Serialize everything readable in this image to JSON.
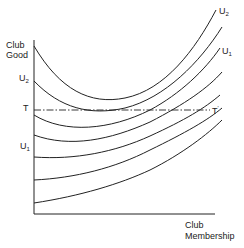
{
  "diagram": {
    "title": "",
    "y_axis_label": [
      "Club",
      "Good"
    ],
    "x_axis_label": [
      "Club",
      "Membership"
    ],
    "left_labels": [
      {
        "text": "U",
        "sub": "2"
      },
      {
        "text": "T",
        "sub": ""
      },
      {
        "text": "U",
        "sub": "1"
      }
    ],
    "right_labels": [
      {
        "text": "U",
        "sub": "2"
      },
      {
        "text": "U",
        "sub": "1"
      },
      {
        "text": "T",
        "sub": "'"
      }
    ],
    "curves": [
      {
        "name": "indifference-curve-1",
        "d": "M34,46 C60,90 90,105 125,98 C165,90 195,50 216,10"
      },
      {
        "name": "indifference-curve-2",
        "d": "M34,81 C60,108 90,116 125,108 C165,98 200,62 222,27"
      },
      {
        "name": "indifference-curve-3",
        "d": "M34,115 C65,134 110,130 150,110 C180,94 205,70 220,48"
      },
      {
        "name": "indifference-curve-4",
        "d": "M34,135 C70,148 110,140 150,122 C185,104 208,88 222,72"
      },
      {
        "name": "indifference-curve-5",
        "d": "M34,157 C75,160 115,152 150,136 C185,120 205,108 220,95"
      },
      {
        "name": "indifference-curve-6",
        "d": "M34,180 C75,178 115,168 150,150 C185,133 208,120 222,108"
      },
      {
        "name": "indifference-curve-7",
        "d": "M34,203 C80,196 120,184 150,170 C182,154 208,134 222,120"
      }
    ],
    "t_line": {
      "y": 110,
      "x1": 34,
      "x2": 210
    },
    "colors": {
      "line": "#222222",
      "background": "#ffffff"
    }
  }
}
